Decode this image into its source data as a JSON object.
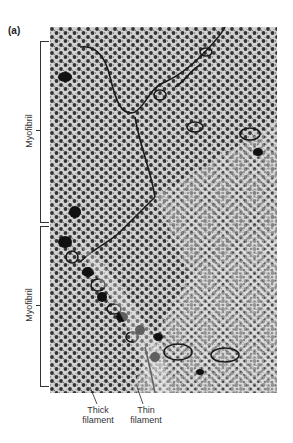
{
  "figure": {
    "panel_label": "(a)",
    "image_description": "Electron micrograph cross-section of muscle myofibrils showing hexagonal lattice of thick and thin filaments",
    "brackets": [
      {
        "label": "Myofibril"
      },
      {
        "label": "Myofibril"
      }
    ],
    "annotations": [
      {
        "line1": "Thick",
        "line2": "filament"
      },
      {
        "line1": "Thin",
        "line2": "filament"
      }
    ],
    "colors": {
      "background": "#ffffff",
      "micrograph_base": "#c9c9c9",
      "dots": "#3a3a3a",
      "membrane": "#1a1a1a",
      "label_text": "#333333"
    }
  }
}
